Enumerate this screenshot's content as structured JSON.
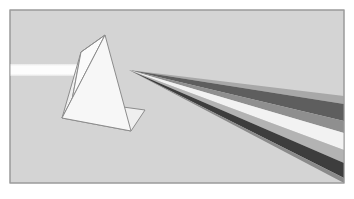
{
  "figure": {
    "caption": "A triangular glass prism refracts an incoming horizontal white light beam and disperses it into a fan of separated spectral bands spreading toward the lower right.",
    "canvas": {
      "width": 354,
      "height": 199,
      "background_color": "#ffffff"
    },
    "panel": {
      "label": "Illustration panel",
      "x": 10,
      "y": 10,
      "width": 334,
      "height": 173,
      "fill_color": "#d4d4d4",
      "border_color": "#9a9a9a",
      "border_width": 1
    },
    "incoming_beam": {
      "label": "Incident white light beam",
      "color": "#fbfbfb",
      "edge_color": "#e8e8e8",
      "start_x": 10,
      "end_x": 86,
      "top_y": 64,
      "bottom_y": 76
    },
    "prism": {
      "label": "Triangular glass prism",
      "apex": {
        "x": 105,
        "y": 35
      },
      "front_face_fill": "#f7f7f7",
      "left_face_fill": "#fbfbfb",
      "base_face_fill": "#efefef",
      "outline_color": "#8c8c8c",
      "outline_width": 1,
      "vertices": {
        "apex_front": {
          "x": 105,
          "y": 35
        },
        "apex_back": {
          "x": 81,
          "y": 52
        },
        "front_left": {
          "x": 62,
          "y": 118
        },
        "front_right": {
          "x": 131,
          "y": 131
        },
        "back_left": {
          "x": 72,
          "y": 100
        },
        "back_right": {
          "x": 145,
          "y": 110
        }
      }
    },
    "dispersion": {
      "label": "Dispersed spectrum fan",
      "origin": {
        "x": 129,
        "y": 70
      },
      "right_edge_x": 344,
      "band_count": 7,
      "bands": [
        {
          "name": "band-1-upper-mid-gray",
          "color": "#a8a8a8",
          "top_y_at_edge": 96,
          "bottom_y_at_edge": 104
        },
        {
          "name": "band-2-dark-gray",
          "color": "#5e5e5e",
          "top_y_at_edge": 104,
          "bottom_y_at_edge": 121
        },
        {
          "name": "band-3-mid-gray",
          "color": "#8f8f8f",
          "top_y_at_edge": 121,
          "bottom_y_at_edge": 133
        },
        {
          "name": "band-4-near-white",
          "color": "#f2f2f2",
          "top_y_at_edge": 133,
          "bottom_y_at_edge": 150
        },
        {
          "name": "band-5-light-gray",
          "color": "#b3b3b3",
          "top_y_at_edge": 150,
          "bottom_y_at_edge": 163
        },
        {
          "name": "band-6-darkest",
          "color": "#3d3d3d",
          "top_y_at_edge": 163,
          "bottom_y_at_edge": 178
        },
        {
          "name": "band-7-shadow-gray",
          "color": "#8a8a8a",
          "top_y_at_edge": 178,
          "bottom_y_at_edge": 183
        }
      ]
    }
  }
}
